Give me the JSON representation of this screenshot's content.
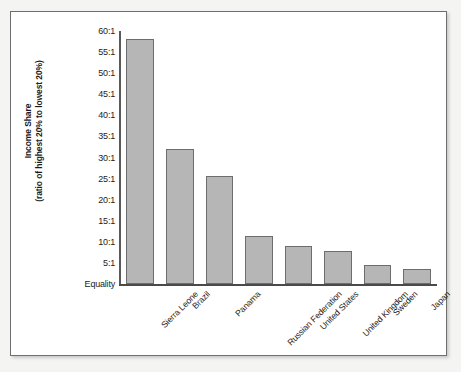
{
  "figure": {
    "background_color": "#ffffff",
    "frame_color": "#6f6f6f",
    "mat_color": "#f4f4f2"
  },
  "axis": {
    "y_title_line1": "Income Share",
    "y_title_line2": "(ratio of highest 20% to lowest 20%)",
    "baseline_label": "Equality"
  },
  "chart_data": {
    "type": "bar",
    "title": "",
    "xlabel": "",
    "ylabel": "Income Share (ratio of highest 20% to lowest 20%)",
    "categories": [
      "Sierra Leone",
      "Brazil",
      "Panama",
      "Russian Federation",
      "United States",
      "United Kingdom",
      "Sweden",
      "Japan"
    ],
    "values": [
      58,
      32,
      25.5,
      11.3,
      9,
      7.8,
      4.6,
      3.6
    ],
    "ylim": [
      0,
      60
    ],
    "ytick_values": [
      60,
      55,
      50,
      45,
      40,
      35,
      30,
      25,
      20,
      15,
      10,
      5,
      0
    ],
    "ytick_labels": [
      "60:1",
      "55:1",
      "50:1",
      "45:1",
      "40:1",
      "35:1",
      "30:1",
      "25:1",
      "20:1",
      "15:1",
      "10:1",
      "5:1",
      "Equality"
    ],
    "grid": false,
    "legend": null,
    "bar_fill_color": "#b6b6b6",
    "bar_edge_color": "#6d6d6d",
    "orientation": "vertical",
    "xtick_rotation": -45
  }
}
